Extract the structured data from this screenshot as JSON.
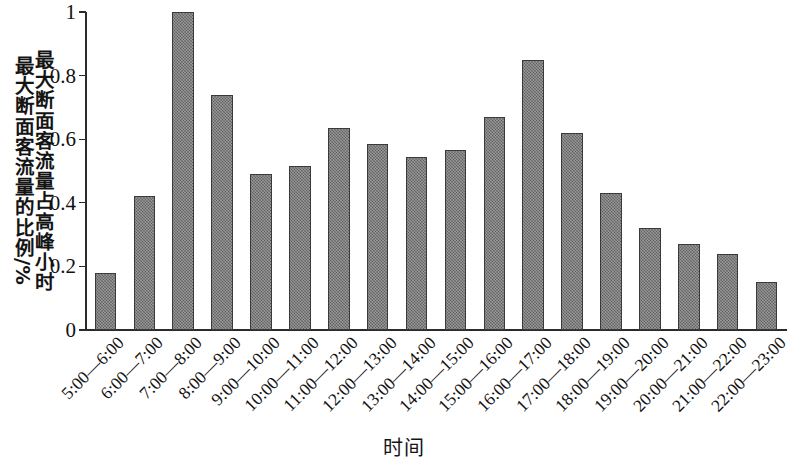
{
  "chart_data": {
    "type": "bar",
    "title": "",
    "xlabel": "时间",
    "ylabel": "最大断面客流量占高峰小时最大断面客流量的比例/%",
    "ylabel_lines": [
      "最大断面客流量占高峰小时",
      "最大断面客流量的比例/%"
    ],
    "categories": [
      "5:00—6:00",
      "6:00—7:00",
      "7:00—8:00",
      "8:00—9:00",
      "9:00—10:00",
      "10:00—11:00",
      "11:00—12:00",
      "12:00—13:00",
      "13:00—14:00",
      "14:00—15:00",
      "15:00—16:00",
      "16:00—17:00",
      "17:00—18:00",
      "18:00—19:00",
      "19:00—20:00",
      "20:00—21:00",
      "21:00—22:00",
      "22:00—23:00"
    ],
    "values": [
      0.18,
      0.42,
      1.0,
      0.74,
      0.49,
      0.515,
      0.635,
      0.585,
      0.545,
      0.565,
      0.67,
      0.85,
      0.62,
      0.43,
      0.32,
      0.27,
      0.24,
      0.15
    ],
    "ylim": [
      0,
      1
    ],
    "ytick_labels": [
      "0",
      "0.2",
      "0.4",
      "0.6",
      "0.8",
      "1"
    ],
    "ytick_values": [
      0,
      0.2,
      0.4,
      0.6,
      0.8,
      1
    ],
    "grid": false,
    "legend": null,
    "bar_color": "#6e6e6e",
    "bar_edge_color": "#3a3a3a",
    "axis_color": "#2b2b2b",
    "background_color": "#ffffff",
    "xtick_rotation": 45
  }
}
